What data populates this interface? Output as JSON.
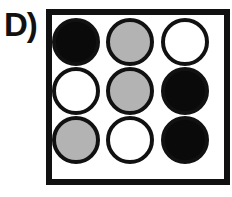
{
  "label": "D)",
  "grid": {
    "rows": 3,
    "cols": 3,
    "cells": [
      [
        "black",
        "gray",
        "white"
      ],
      [
        "white",
        "gray",
        "black"
      ],
      [
        "gray",
        "white",
        "black"
      ]
    ]
  },
  "colors": {
    "black": "#0a0a0a",
    "gray": "#b3b3b3",
    "white": "#ffffff",
    "frame": "#111111"
  }
}
